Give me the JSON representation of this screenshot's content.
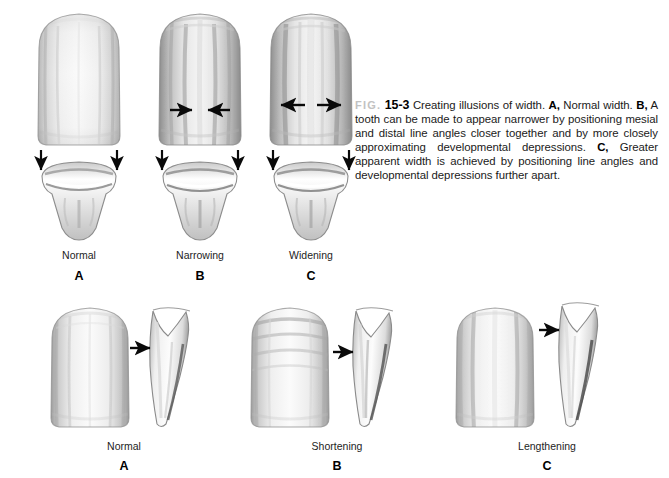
{
  "figure": {
    "fig_label": "FIG.",
    "fig_number": "15-3",
    "caption_part1": "Creating illusions of width. ",
    "caption_a_bold": "A,",
    "caption_a_text": " Normal width. ",
    "caption_b_bold": "B,",
    "caption_b_text": " A tooth can be made to appear narrower by positioning mesial and distal line angles closer together and by more closely approximating developmental depressions. ",
    "caption_c_bold": "C,",
    "caption_c_text": " Greater apparent width is achieved by positioning line angles and developmental depressions further apart.",
    "caption_full": "FIG. 15-3 Creating illusions of width. A, Normal width. B, A tooth can be made to appear narrower by positioning mesial and distal line angles closer together and by more closely approximating developmental depressions. C, Greater apparent width is achieved by positioning line angles and developmental depressions further apart."
  },
  "top_row": {
    "view_note": "facial view above, incisal cross-section view below",
    "panels": [
      {
        "label": "Normal",
        "letter": "A",
        "arrow_mode": "none",
        "arrow_label": "no-horizontal-arrows"
      },
      {
        "label": "Narrowing",
        "letter": "B",
        "arrow_mode": "inward",
        "arrow_label": "arrows-pointing-inward"
      },
      {
        "label": "Widening",
        "letter": "C",
        "arrow_mode": "outward",
        "arrow_label": "arrows-pointing-outward"
      }
    ]
  },
  "bottom_row": {
    "view_note": "facial view at left, proximal (side) view at right with arrow at cervical line angle",
    "panels": [
      {
        "label": "Normal",
        "letter": "A",
        "ridge_style": "balanced"
      },
      {
        "label": "Shortening",
        "letter": "B",
        "ridge_style": "horizontal-ridges"
      },
      {
        "label": "Lengthening",
        "letter": "C",
        "ridge_style": "vertical-ridges"
      }
    ]
  },
  "colors": {
    "background": "#ffffff",
    "ink": "#1a1a1a",
    "fig_label_gray": "#c2c2c2",
    "tooth_light": "#f7f7f7",
    "tooth_mid": "#d8d8d8",
    "tooth_shadow": "#9a9a9a",
    "arrow_black": "#0a0a0a"
  }
}
